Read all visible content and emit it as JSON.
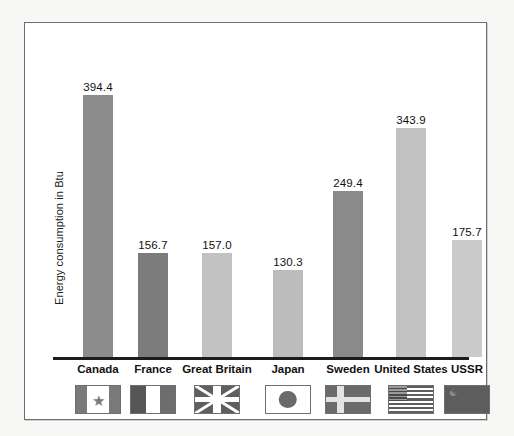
{
  "chart_data": {
    "type": "bar",
    "title": "",
    "xlabel": "",
    "ylabel": "Energy consumption in Btu",
    "ylim": [
      0,
      430
    ],
    "grid": false,
    "legend": "none",
    "categories": [
      "Canada",
      "France",
      "Great Britain",
      "Japan",
      "Sweden",
      "United States",
      "USSR"
    ],
    "values": [
      394.4,
      156.7,
      157.0,
      130.3,
      249.4,
      343.9,
      175.7
    ],
    "value_labels": [
      "394.4",
      "156.7",
      "157.0",
      "130.3",
      "249.4",
      "343.9",
      "175.7"
    ],
    "bar_colors": [
      "#8c8c8c",
      "#7c7c7c",
      "#c2c2c2",
      "#bcbcbc",
      "#8a8a8a",
      "#c2c2c2",
      "#cacaca"
    ],
    "flags": [
      "canada-flag",
      "france-flag",
      "great-britain-flag",
      "japan-flag",
      "sweden-flag",
      "united-states-flag",
      "ussr-flag"
    ],
    "annotations": "Value labels printed above each bar; national flag icon printed beneath each category label."
  },
  "colors": {
    "bar_dark": "#8c8c8c",
    "bar_light": "#c2c2c2",
    "axis": "#1c1c1c",
    "frame": "#6e6e6e",
    "page_background": "#f7f7f6",
    "plot_background": "#ffffff",
    "text": "#111111"
  }
}
